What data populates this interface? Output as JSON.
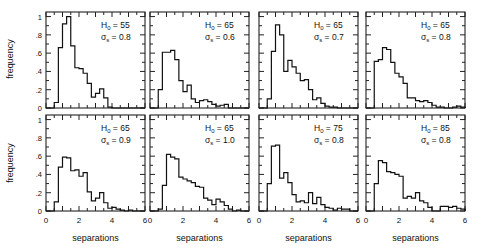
{
  "figure": {
    "ylabel": "frequency",
    "xlabel": "separations",
    "y_ticks": [
      "0",
      ".2",
      ".4",
      ".6",
      ".8",
      "1"
    ],
    "x_ticks": [
      "0",
      "2",
      "4",
      "6"
    ]
  },
  "chart_data": {
    "type": "bar",
    "subtype": "histogram-grid",
    "layout": {
      "rows": 2,
      "cols": 4
    },
    "xlabel": "separations",
    "ylabel": "frequency",
    "xlim": [
      0,
      6
    ],
    "ylim": [
      0,
      1.05
    ],
    "bin_width": 0.25,
    "bin_start": 0,
    "panels": [
      {
        "H0": "55",
        "sigma": "0.8",
        "row": 0,
        "col": 0,
        "values": [
          0,
          0,
          0.06,
          0.66,
          0.92,
          1.0,
          0.68,
          0.44,
          0.43,
          0.38,
          0.27,
          0.12,
          0.16,
          0.21,
          0.11,
          0.01,
          0,
          0,
          0,
          0,
          0,
          0,
          0,
          0
        ]
      },
      {
        "H0": "65",
        "sigma": "0.6",
        "row": 0,
        "col": 1,
        "values": [
          0,
          0,
          0.2,
          0.61,
          0.61,
          0.63,
          0.53,
          0.3,
          0.18,
          0.25,
          0.1,
          0.06,
          0.08,
          0.09,
          0.07,
          0.04,
          0.02,
          0.03,
          0.04,
          0,
          0,
          0,
          0,
          0
        ]
      },
      {
        "H0": "65",
        "sigma": "0.7",
        "row": 0,
        "col": 2,
        "values": [
          0,
          0,
          0.1,
          0.62,
          0.91,
          0.8,
          0.4,
          0.52,
          0.45,
          0.38,
          0.3,
          0.31,
          0.2,
          0.09,
          0.11,
          0.05,
          0.02,
          0.01,
          0.01,
          0,
          0,
          0,
          0,
          0
        ]
      },
      {
        "H0": "65",
        "sigma": "0.8",
        "row": 0,
        "col": 3,
        "values": [
          0,
          0,
          0.51,
          0.53,
          0.66,
          0.64,
          0.5,
          0.38,
          0.34,
          0.27,
          0.11,
          0.11,
          0.08,
          0.07,
          0.08,
          0.06,
          0.03,
          0.01,
          0.01,
          0,
          0,
          0.01,
          0.02,
          0.01
        ]
      },
      {
        "H0": "65",
        "sigma": "0.9",
        "row": 1,
        "col": 0,
        "values": [
          0,
          0,
          0.1,
          0.48,
          0.59,
          0.58,
          0.44,
          0.45,
          0.38,
          0.42,
          0.21,
          0.11,
          0.14,
          0.2,
          0.09,
          0.03,
          0.04,
          0.02,
          0.01,
          0,
          0.01,
          0,
          0,
          0
        ]
      },
      {
        "H0": "65",
        "sigma": "1.0",
        "row": 1,
        "col": 1,
        "values": [
          0,
          0,
          0.02,
          0.28,
          0.62,
          0.59,
          0.57,
          0.37,
          0.35,
          0.33,
          0.31,
          0.27,
          0.26,
          0.14,
          0.12,
          0.07,
          0.13,
          0.1,
          0.06,
          0.02,
          0,
          0.01,
          0,
          0
        ]
      },
      {
        "H0": "75",
        "sigma": "0.8",
        "row": 1,
        "col": 2,
        "values": [
          0,
          0,
          0.3,
          0.71,
          0.72,
          0.36,
          0.42,
          0.31,
          0.18,
          0.1,
          0.11,
          0.09,
          0.2,
          0.08,
          0.15,
          0.07,
          0.04,
          0.03,
          0.01,
          0.03,
          0.02,
          0.02,
          0,
          0
        ]
      },
      {
        "H0": "85",
        "sigma": "0.8",
        "row": 1,
        "col": 3,
        "values": [
          0,
          0,
          0.3,
          0.55,
          0.53,
          0.43,
          0.42,
          0.4,
          0.38,
          0.14,
          0.16,
          0.14,
          0.2,
          0.11,
          0.09,
          0.04,
          0,
          0,
          0.05,
          0.05,
          0.04,
          0.05,
          0.03,
          0.02
        ]
      }
    ]
  }
}
